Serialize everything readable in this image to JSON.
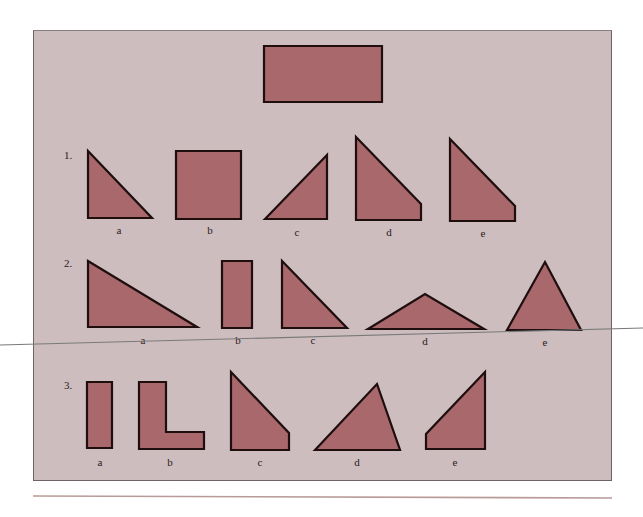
{
  "figure": {
    "background_color": "#cdbdbe",
    "shape_fill": "#a8686c",
    "shape_stroke": "#1e0e0e",
    "reference_shape": {
      "name": "rectangle",
      "points": "264,46 382,46 382,102 264,102"
    },
    "rows": [
      {
        "number": "1.",
        "number_pos": [
          64,
          159
        ],
        "options": [
          {
            "label": "a",
            "shape": "right-triangle",
            "points": "88,151 88,218 152,218",
            "label_pos": [
              119,
              234
            ]
          },
          {
            "label": "b",
            "shape": "square",
            "points": "176,151 241,151 241,219 176,219",
            "label_pos": [
              210,
              234
            ]
          },
          {
            "label": "c",
            "shape": "right-triangle",
            "points": "265,219 327,155 327,219",
            "label_pos": [
              297,
              236
            ]
          },
          {
            "label": "d",
            "shape": "trapezoid",
            "points": "356,137 421,204 421,220 356,220",
            "label_pos": [
              389,
              236
            ]
          },
          {
            "label": "e",
            "shape": "trapezoid",
            "points": "450,139 515,206 515,221 450,221",
            "label_pos": [
              483,
              237
            ]
          }
        ]
      },
      {
        "number": "2.",
        "number_pos": [
          64,
          267
        ],
        "options": [
          {
            "label": "a",
            "shape": "right-triangle",
            "points": "88,261 88,327 197,327",
            "label_pos": [
              143,
              344
            ]
          },
          {
            "label": "b",
            "shape": "rectangle",
            "points": "222,261 252,261 252,328 222,328",
            "label_pos": [
              238,
              344
            ]
          },
          {
            "label": "c",
            "shape": "right-triangle",
            "points": "282,261 282,328 347,328",
            "label_pos": [
              313,
              344
            ]
          },
          {
            "label": "d",
            "shape": "obtuse-triangle",
            "points": "368,329 425,294 484,329",
            "label_pos": [
              425,
              345
            ]
          },
          {
            "label": "e",
            "shape": "acute-triangle",
            "points": "507,330 545,262 581,330",
            "label_pos": [
              545,
              346
            ]
          }
        ]
      },
      {
        "number": "3.",
        "number_pos": [
          64,
          389
        ],
        "options": [
          {
            "label": "a",
            "shape": "rectangle",
            "points": "87,382 112,382 112,448 87,448",
            "label_pos": [
              100,
              466
            ]
          },
          {
            "label": "b",
            "shape": "l-shape",
            "points": "139,382 166,382 166,432 204,432 204,449 139,449",
            "label_pos": [
              170,
              466
            ]
          },
          {
            "label": "c",
            "shape": "trapezoid",
            "points": "231,372 289,433 289,450 231,450",
            "label_pos": [
              260,
              466
            ]
          },
          {
            "label": "d",
            "shape": "scalene-triangle",
            "points": "315,450 377,384 400,450",
            "label_pos": [
              357,
              466
            ]
          },
          {
            "label": "e",
            "shape": "trapezoid",
            "points": "426,449 426,434 485,372 485,449",
            "label_pos": [
              455,
              466
            ]
          }
        ]
      }
    ],
    "overlay_line": {
      "x1": 0,
      "y1": 345,
      "x2": 643,
      "y2": 328
    },
    "bottom_rule": {
      "x1": 33,
      "y1": 496,
      "x2": 612,
      "y2": 498
    }
  }
}
